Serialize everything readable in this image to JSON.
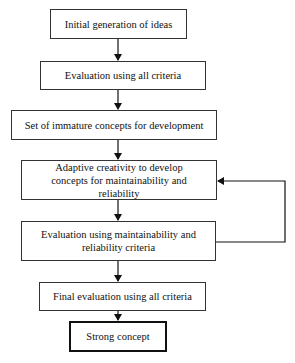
{
  "diagram": {
    "type": "flowchart",
    "nodes": [
      {
        "id": "n1",
        "label": "Initial generation of ideas"
      },
      {
        "id": "n2",
        "label": "Evaluation using all criteria"
      },
      {
        "id": "n3",
        "label": "Set of immature concepts for development"
      },
      {
        "id": "n4",
        "label": "Adaptive creativity to develop concepts for maintainability and reliability"
      },
      {
        "id": "n5",
        "label": "Evaluation using maintainability and reliability criteria"
      },
      {
        "id": "n6",
        "label": "Final evaluation using all criteria"
      },
      {
        "id": "n7",
        "label": "Strong concept"
      }
    ],
    "edges": [
      {
        "from": "n1",
        "to": "n2"
      },
      {
        "from": "n2",
        "to": "n3"
      },
      {
        "from": "n3",
        "to": "n4"
      },
      {
        "from": "n4",
        "to": "n5"
      },
      {
        "from": "n5",
        "to": "n4",
        "type": "feedback-loop"
      },
      {
        "from": "n5",
        "to": "n6"
      },
      {
        "from": "n6",
        "to": "n7"
      }
    ]
  }
}
